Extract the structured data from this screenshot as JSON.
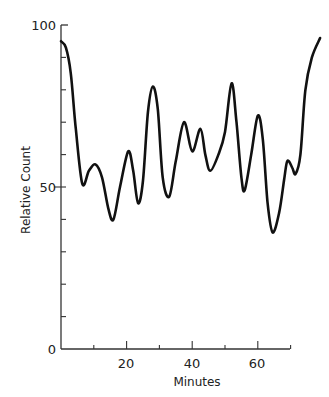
{
  "chart_data": {
    "type": "line",
    "title": "",
    "xlabel": "Minutes",
    "ylabel": "Relative Count",
    "xlim": [
      0,
      80
    ],
    "ylim": [
      0,
      100
    ],
    "grid": false,
    "legend": null,
    "x_ticks_major": [
      20,
      40,
      60
    ],
    "x_ticks_minor": [
      10,
      30,
      50,
      70
    ],
    "y_ticks_labeled": [
      0,
      50,
      100
    ],
    "y_ticks_minor": [
      10,
      20,
      30,
      40,
      60,
      70,
      80,
      90
    ],
    "series": [
      {
        "name": "Relative Count",
        "color": "#111111",
        "points": [
          [
            0,
            95
          ],
          [
            1.5,
            93
          ],
          [
            3,
            85
          ],
          [
            4.5,
            68
          ],
          [
            6.5,
            51
          ],
          [
            8.5,
            55
          ],
          [
            10.5,
            57
          ],
          [
            12.5,
            53
          ],
          [
            14.5,
            43
          ],
          [
            16,
            40
          ],
          [
            18,
            50
          ],
          [
            20.5,
            61
          ],
          [
            22,
            55
          ],
          [
            23.5,
            45
          ],
          [
            25,
            52
          ],
          [
            26.5,
            73
          ],
          [
            28,
            81
          ],
          [
            29.5,
            74
          ],
          [
            31,
            53
          ],
          [
            33,
            47
          ],
          [
            35,
            58
          ],
          [
            37.5,
            70
          ],
          [
            40,
            61
          ],
          [
            42.5,
            68
          ],
          [
            44,
            60
          ],
          [
            45.5,
            55
          ],
          [
            48,
            60
          ],
          [
            50,
            67
          ],
          [
            52,
            82
          ],
          [
            53.5,
            70
          ],
          [
            55,
            53
          ],
          [
            56,
            49
          ],
          [
            58,
            60
          ],
          [
            60,
            72
          ],
          [
            61.5,
            65
          ],
          [
            63,
            45
          ],
          [
            64.5,
            36
          ],
          [
            66.5,
            42
          ],
          [
            68,
            52
          ],
          [
            69,
            58
          ],
          [
            70.5,
            56
          ],
          [
            71.5,
            54
          ],
          [
            73,
            60
          ],
          [
            74.5,
            80
          ],
          [
            76.5,
            90
          ],
          [
            79,
            96
          ]
        ]
      }
    ]
  },
  "axes": {
    "x_labels": [
      "20",
      "40",
      "60"
    ],
    "y_labels": [
      "0",
      "50",
      "100"
    ],
    "x_title": "Minutes",
    "y_title": "Relative Count"
  }
}
